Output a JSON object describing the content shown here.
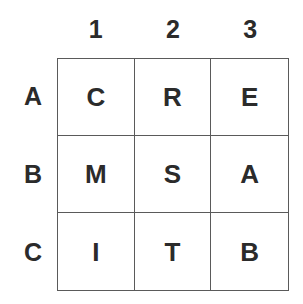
{
  "figure": {
    "kind": "letter-grid",
    "background_color": "#ffffff",
    "line_color": "#5a5a5a",
    "text_color": "#2b2b2b"
  },
  "grid": {
    "rows": 3,
    "columns": 3,
    "column_headers": [
      "1",
      "2",
      "3"
    ],
    "row_headers": [
      "A",
      "B",
      "C"
    ],
    "cells": [
      [
        "C",
        "R",
        "E"
      ],
      [
        "M",
        "S",
        "A"
      ],
      [
        "I",
        "T",
        "B"
      ]
    ],
    "cell_labels": [
      [
        "A1",
        "A2",
        "A3"
      ],
      [
        "B1",
        "B2",
        "B3"
      ],
      [
        "C1",
        "C2",
        "C3"
      ]
    ]
  }
}
